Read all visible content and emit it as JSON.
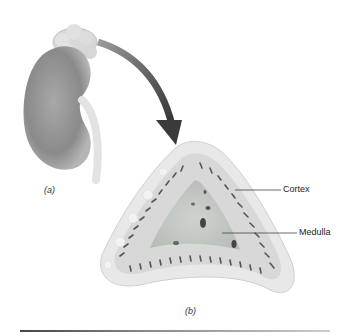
{
  "figure": {
    "panel_a": {
      "caption": "(a)",
      "subject": "kidney with adrenal gland on top"
    },
    "arrow": {
      "from": "adrenal gland",
      "to": "cross-section",
      "color": "#4a4a4a"
    },
    "panel_b": {
      "caption": "(b)",
      "subject": "adrenal gland cross-section",
      "labels": [
        {
          "text": "Cortex"
        },
        {
          "text": "Medulla"
        }
      ]
    }
  },
  "colors": {
    "kidney": "#8c8c8c",
    "capsule": "#e6e6e6",
    "cortex": "#d9d9d9",
    "medulla": "#c4c8c4",
    "stripes": "#555555"
  }
}
